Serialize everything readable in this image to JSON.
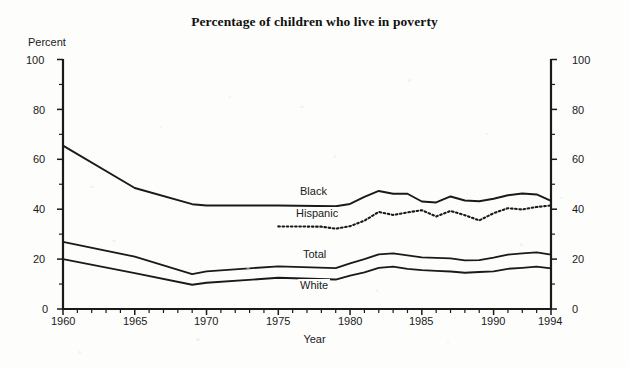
{
  "title": "Percentage of children who live in poverty",
  "axes": {
    "y_label": "Percent",
    "x_label": "Year",
    "y_ticks_left": [
      "0",
      "20",
      "40",
      "60",
      "80",
      "100"
    ],
    "y_ticks_right": [
      "0",
      "20",
      "40",
      "60",
      "80",
      "100"
    ],
    "x_ticks": [
      "1960",
      "1965",
      "1970",
      "1975",
      "1980",
      "1985",
      "1990",
      "1994"
    ]
  },
  "series_labels": {
    "black": "Black",
    "hispanic": "Hispanic",
    "total": "Total",
    "white": "White"
  },
  "chart_data": {
    "type": "line",
    "title": "Percentage of children who live in poverty",
    "xlabel": "Year",
    "ylabel": "Percent",
    "xlim": [
      1960,
      1994
    ],
    "ylim": [
      0,
      100
    ],
    "grid": false,
    "legend": "inline-labels",
    "y_major_ticks": [
      0,
      20,
      40,
      60,
      80,
      100
    ],
    "y_minor_ticks": [
      10,
      30,
      50,
      70,
      90
    ],
    "x_tick_values": [
      1960,
      1965,
      1970,
      1975,
      1980,
      1985,
      1990,
      1994
    ],
    "x_minor_tick_interval": 1,
    "series": [
      {
        "name": "Black",
        "style": "solid",
        "color": "#1a1a1a",
        "x": [
          1960,
          1965,
          1969,
          1970,
          1975,
          1979,
          1980,
          1981,
          1982,
          1983,
          1984,
          1985,
          1986,
          1987,
          1988,
          1989,
          1990,
          1991,
          1992,
          1993,
          1994
        ],
        "values": [
          65.5,
          48.5,
          42.0,
          41.5,
          41.5,
          41.2,
          42.1,
          44.9,
          47.3,
          46.2,
          46.2,
          43.1,
          42.7,
          45.1,
          43.5,
          43.2,
          44.2,
          45.6,
          46.3,
          45.9,
          43.3
        ]
      },
      {
        "name": "Hispanic",
        "style": "dotted",
        "color": "#1a1a1a",
        "x": [
          1975,
          1978,
          1979,
          1980,
          1981,
          1982,
          1983,
          1984,
          1985,
          1986,
          1987,
          1988,
          1989,
          1990,
          1991,
          1992,
          1993,
          1994
        ],
        "values": [
          33.1,
          33.0,
          32.2,
          33.2,
          35.4,
          38.9,
          37.7,
          38.7,
          39.6,
          37.1,
          39.3,
          37.6,
          35.5,
          38.4,
          40.4,
          39.9,
          40.9,
          41.5
        ]
      },
      {
        "name": "Total",
        "style": "solid",
        "color": "#1a1a1a",
        "x": [
          1960,
          1965,
          1969,
          1970,
          1975,
          1979,
          1980,
          1981,
          1982,
          1983,
          1984,
          1985,
          1986,
          1987,
          1988,
          1989,
          1990,
          1991,
          1992,
          1993,
          1994
        ],
        "values": [
          26.9,
          21.0,
          14.0,
          15.1,
          17.1,
          16.4,
          18.3,
          20.0,
          21.9,
          22.3,
          21.5,
          20.7,
          20.5,
          20.3,
          19.5,
          19.6,
          20.6,
          21.8,
          22.3,
          22.7,
          21.8
        ]
      },
      {
        "name": "White",
        "style": "solid",
        "color": "#1a1a1a",
        "x": [
          1960,
          1965,
          1969,
          1970,
          1975,
          1979,
          1980,
          1981,
          1982,
          1983,
          1984,
          1985,
          1986,
          1987,
          1988,
          1989,
          1990,
          1991,
          1992,
          1993,
          1994
        ],
        "values": [
          20.0,
          14.4,
          9.7,
          10.5,
          12.5,
          11.8,
          13.4,
          14.7,
          16.5,
          17.0,
          16.1,
          15.6,
          15.3,
          15.0,
          14.5,
          14.8,
          15.1,
          16.1,
          16.5,
          17.0,
          16.3
        ]
      }
    ]
  }
}
